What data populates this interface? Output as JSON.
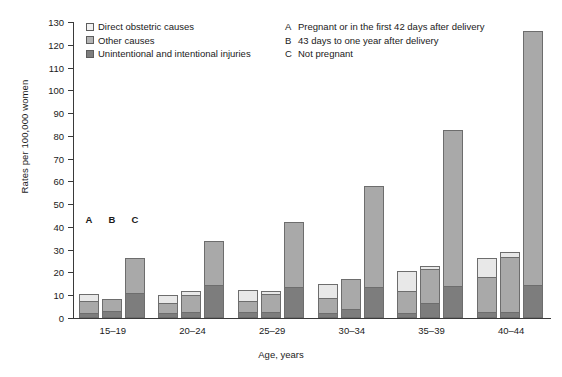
{
  "chart_data": {
    "type": "bar",
    "title": "",
    "xlabel": "Age, years",
    "ylabel": "Rates per 100,000 women",
    "ylim": [
      0,
      130
    ],
    "ytick_step": 10,
    "yticks": [
      0,
      10,
      20,
      30,
      40,
      50,
      60,
      70,
      80,
      90,
      100,
      110,
      120,
      130
    ],
    "grid": false,
    "stacked": true,
    "legend_position": "top-left",
    "categories": [
      "15–19",
      "20–24",
      "25–29",
      "30–34",
      "35–39",
      "40–44"
    ],
    "subcategories": [
      "A",
      "B",
      "C"
    ],
    "series": [
      {
        "name": "Direct obstetric causes",
        "color": "#e8e8e8"
      },
      {
        "name": "Other causes",
        "color": "#a9a9a9"
      },
      {
        "name": "Unintentional and intentional injuries",
        "color": "#7d7d7d"
      }
    ],
    "bars": [
      {
        "group": "15–19",
        "sub": "A",
        "direct": 3.0,
        "other": 5.5,
        "injuries": 2.0,
        "total": 10.5
      },
      {
        "group": "15–19",
        "sub": "B",
        "direct": 0.0,
        "other": 5.5,
        "injuries": 3.0,
        "total": 8.5
      },
      {
        "group": "15–19",
        "sub": "C",
        "direct": 0.0,
        "other": 15.5,
        "injuries": 11.0,
        "total": 26.5
      },
      {
        "group": "20–24",
        "sub": "A",
        "direct": 3.5,
        "other": 4.5,
        "injuries": 2.0,
        "total": 10.0
      },
      {
        "group": "20–24",
        "sub": "B",
        "direct": 2.0,
        "other": 7.5,
        "injuries": 2.5,
        "total": 12.0
      },
      {
        "group": "20–24",
        "sub": "C",
        "direct": 0.0,
        "other": 19.5,
        "injuries": 14.5,
        "total": 34.0
      },
      {
        "group": "25–29",
        "sub": "A",
        "direct": 5.0,
        "other": 5.0,
        "injuries": 2.5,
        "total": 12.5
      },
      {
        "group": "25–29",
        "sub": "B",
        "direct": 1.5,
        "other": 8.0,
        "injuries": 2.5,
        "total": 12.0
      },
      {
        "group": "25–29",
        "sub": "C",
        "direct": 0.0,
        "other": 28.5,
        "injuries": 13.5,
        "total": 42.0
      },
      {
        "group": "30–34",
        "sub": "A",
        "direct": 6.0,
        "other": 7.0,
        "injuries": 2.0,
        "total": 15.0
      },
      {
        "group": "30–34",
        "sub": "B",
        "direct": 0.0,
        "other": 13.0,
        "injuries": 4.0,
        "total": 17.0
      },
      {
        "group": "30–34",
        "sub": "C",
        "direct": 0.0,
        "other": 44.5,
        "injuries": 13.5,
        "total": 58.0
      },
      {
        "group": "35–39",
        "sub": "A",
        "direct": 8.5,
        "other": 10.0,
        "injuries": 2.0,
        "total": 20.5
      },
      {
        "group": "35–39",
        "sub": "B",
        "direct": 1.5,
        "other": 15.0,
        "injuries": 6.5,
        "total": 23.0
      },
      {
        "group": "35–39",
        "sub": "C",
        "direct": 0.0,
        "other": 68.5,
        "injuries": 14.0,
        "total": 82.5
      },
      {
        "group": "40–44",
        "sub": "A",
        "direct": 8.5,
        "other": 15.5,
        "injuries": 2.5,
        "total": 26.5
      },
      {
        "group": "40–44",
        "sub": "B",
        "direct": 2.0,
        "other": 24.5,
        "injuries": 2.5,
        "total": 29.0
      },
      {
        "group": "40–44",
        "sub": "C",
        "direct": 0.0,
        "other": 111.5,
        "injuries": 14.5,
        "total": 126.0
      }
    ]
  },
  "legend": {
    "items": [
      {
        "label": "Direct obstetric causes",
        "swatch": "swatch-direct-obstetric"
      },
      {
        "label": "Other causes",
        "swatch": "swatch-other-causes"
      },
      {
        "label": "Unintentional and intentional injuries",
        "swatch": "swatch-injuries"
      }
    ]
  },
  "note": {
    "rows": [
      {
        "key": "A",
        "text": "Pregnant or in the first 42 days after delivery"
      },
      {
        "key": "B",
        "text": "43 days to one year after delivery"
      },
      {
        "key": "C",
        "text": "Not pregnant"
      }
    ]
  },
  "axes": {
    "y_title": "Rates per 100,000 women",
    "x_title": "Age, years"
  },
  "colors": {
    "direct": "#e8e8e8",
    "other": "#a9a9a9",
    "injuries": "#7d7d7d",
    "axis": "#3a3a3a",
    "bar_border": "#6d6d6d"
  }
}
